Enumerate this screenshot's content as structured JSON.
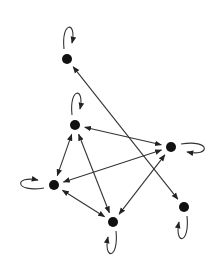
{
  "diagram": {
    "type": "directed-graph",
    "colors": {
      "background": "#ffffff",
      "node": "#111111",
      "edge": "#333333"
    },
    "nodes": [
      {
        "id": "A",
        "x": 67,
        "y": 59,
        "loop": "up"
      },
      {
        "id": "B",
        "x": 75,
        "y": 125,
        "loop": "up"
      },
      {
        "id": "C",
        "x": 171,
        "y": 147,
        "loop": "right"
      },
      {
        "id": "D",
        "x": 54,
        "y": 185,
        "loop": "left"
      },
      {
        "id": "E",
        "x": 113,
        "y": 222,
        "loop": "down"
      },
      {
        "id": "F",
        "x": 184,
        "y": 207,
        "loop": "down"
      }
    ],
    "edges": [
      {
        "from": "A",
        "to": "F",
        "bidirectional": true
      },
      {
        "from": "B",
        "to": "C",
        "bidirectional": true
      },
      {
        "from": "B",
        "to": "D",
        "bidirectional": true
      },
      {
        "from": "B",
        "to": "E",
        "bidirectional": true
      },
      {
        "from": "C",
        "to": "D",
        "bidirectional": true
      },
      {
        "from": "C",
        "to": "E",
        "bidirectional": true
      },
      {
        "from": "D",
        "to": "E",
        "bidirectional": true
      }
    ]
  }
}
